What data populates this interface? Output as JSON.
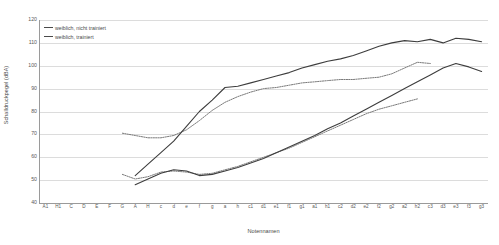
{
  "chart_data": {
    "type": "line",
    "title": "",
    "xlabel": "Notennamen",
    "ylabel": "Schalldruckpegel (dBA)",
    "ylim": [
      40,
      120
    ],
    "yticks": [
      40,
      50,
      60,
      70,
      80,
      90,
      100,
      110,
      120
    ],
    "grid": true,
    "legend_position": "top-left",
    "categories": [
      "A1",
      "H1",
      "C",
      "D",
      "E",
      "F",
      "G",
      "A",
      "H",
      "c",
      "d",
      "e",
      "f",
      "g",
      "a",
      "h",
      "c1",
      "d1",
      "e1",
      "f1",
      "g1",
      "a1",
      "h1",
      "c2",
      "d2",
      "e2",
      "f2",
      "g2",
      "a2",
      "h2",
      "c3",
      "d3",
      "e3",
      "f3",
      "g3"
    ],
    "series": [
      {
        "name": "weiblich, nicht trainiert",
        "style": "dotted",
        "color": "#6b6b6b",
        "x": [
          "G",
          "A",
          "H",
          "c",
          "d",
          "e",
          "f",
          "g",
          "a",
          "h",
          "c1",
          "d1",
          "e1",
          "f1",
          "g1",
          "a1",
          "h1",
          "c2",
          "d2",
          "e2",
          "f2",
          "g2",
          "a2",
          "h2",
          "c3"
        ],
        "values": [
          70.5,
          69.5,
          68.5,
          68.5,
          69.5,
          72.0,
          76.0,
          80.5,
          84.0,
          86.5,
          88.5,
          90.0,
          90.5,
          91.5,
          92.5,
          93.0,
          93.5,
          94.0,
          94.0,
          94.5,
          95.0,
          96.5,
          99.0,
          101.5,
          101.0
        ]
      },
      {
        "name": "weiblich, trainiert",
        "style": "solid",
        "color": "#3d3d3d",
        "x": [
          "A",
          "H",
          "c",
          "d",
          "e",
          "f",
          "g",
          "a",
          "h",
          "c1",
          "d1",
          "e1",
          "f1",
          "g1",
          "a1",
          "h1",
          "c2",
          "d2",
          "e2",
          "f2",
          "g2",
          "a2",
          "h2",
          "c3",
          "d3",
          "e3",
          "f3",
          "g3"
        ],
        "values": [
          52.0,
          57.0,
          62.0,
          67.0,
          73.5,
          80.0,
          85.0,
          90.5,
          91.0,
          92.5,
          94.0,
          95.5,
          97.0,
          99.0,
          100.5,
          102.0,
          103.0,
          104.5,
          106.5,
          108.5,
          110.0,
          111.0,
          110.5,
          111.5,
          110.0,
          112.0,
          111.5,
          110.5
        ]
      },
      {
        "name": "weiblich, nicht trainiert (leise)",
        "style": "dotted",
        "color": "#6b6b6b",
        "x": [
          "G",
          "A",
          "H",
          "c",
          "d",
          "e",
          "f",
          "g",
          "a",
          "h",
          "c1",
          "d1",
          "e1",
          "f1",
          "g1",
          "a1",
          "h1",
          "c2",
          "d2",
          "e2",
          "f2",
          "g2",
          "a2",
          "h2"
        ],
        "values": [
          52.5,
          50.5,
          51.5,
          53.5,
          54.0,
          53.5,
          52.5,
          53.0,
          54.5,
          56.0,
          58.0,
          60.0,
          62.0,
          64.0,
          66.5,
          69.0,
          71.5,
          74.0,
          76.5,
          79.0,
          81.0,
          82.5,
          84.0,
          85.5
        ]
      },
      {
        "name": "weiblich, trainiert (leise)",
        "style": "solid",
        "color": "#3d3d3d",
        "x": [
          "A",
          "H",
          "c",
          "d",
          "e",
          "f",
          "g",
          "a",
          "h",
          "c1",
          "d1",
          "e1",
          "f1",
          "g1",
          "a1",
          "h1",
          "c2",
          "d2",
          "e2",
          "f2",
          "g2",
          "a2",
          "h2",
          "c3",
          "d3",
          "e3",
          "f3",
          "g3"
        ],
        "values": [
          48.0,
          50.5,
          53.0,
          54.5,
          54.0,
          52.0,
          52.5,
          54.0,
          55.5,
          57.5,
          59.5,
          62.0,
          64.5,
          67.0,
          69.5,
          72.5,
          75.0,
          78.0,
          81.0,
          84.0,
          87.0,
          90.0,
          93.0,
          96.0,
          99.0,
          101.0,
          99.5,
          97.5
        ]
      }
    ]
  },
  "legend": {
    "entries": [
      {
        "label": "weiblich, nicht trainiert"
      },
      {
        "label": "weiblich, trainiert"
      }
    ]
  }
}
